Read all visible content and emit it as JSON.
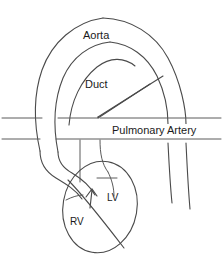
{
  "diagram": {
    "type": "anatomical-line-diagram",
    "background_color": "#ffffff",
    "stroke_color": "#4a4a4a",
    "text_color": "#1a1a1a",
    "width": 223,
    "height": 271,
    "labels": {
      "aorta": "Aorta",
      "duct": "Duct",
      "pulmonary_artery": "Pulmonary Artery",
      "left_ventricle": "LV",
      "right_ventricle": "RV"
    },
    "structures": [
      {
        "name": "aortic-arch",
        "label": "Aorta",
        "description": "large outer arch sweeping from left descending limb over the top and down the right side"
      },
      {
        "name": "ductus-arteriosus",
        "label": "Duct",
        "description": "inner arch connecting aorta to pulmonary artery"
      },
      {
        "name": "pulmonary-artery-trunk",
        "label": "Pulmonary Artery",
        "description": "horizontal vessel crossing the full width at mid height with two parallel walls"
      },
      {
        "name": "ventricular-mass",
        "label": "",
        "description": "tilted ellipse at lower centre containing RV and LV chambers"
      },
      {
        "name": "left-ventricle",
        "label": "LV",
        "description": "right-hand chamber of the ventricular ellipse"
      },
      {
        "name": "right-ventricle",
        "label": "RV",
        "description": "left-hand chamber of the ventricular ellipse"
      },
      {
        "name": "catheter-device",
        "label": "",
        "description": "two parallel diagonal lines running from upper right down to the pulmonary artery, converging at an arrow tip"
      },
      {
        "name": "guide-arrow",
        "label": "",
        "description": "small arrowhead inside ventricle pointing up toward the septum"
      }
    ]
  }
}
